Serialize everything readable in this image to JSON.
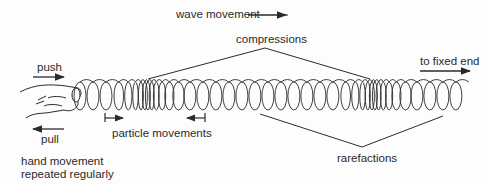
{
  "diagram": {
    "labels": {
      "wave_movement": "wave movement",
      "compressions": "compressions",
      "push": "push",
      "pull": "pull",
      "to_fixed_end": "to fixed end",
      "particle_movements": "particle movements",
      "hand_movement_line1": "hand movement",
      "hand_movement_line2": "repeated regularly",
      "rarefactions": "rarefactions"
    },
    "colors": {
      "ink": "#2a2a2a",
      "background": "#fdfdfd"
    }
  }
}
